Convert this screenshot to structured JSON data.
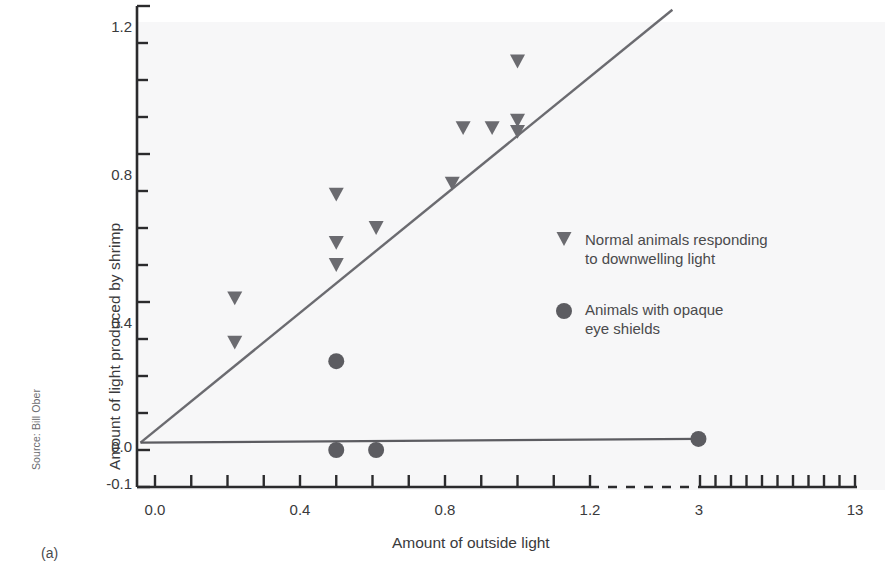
{
  "figure": {
    "panel_label": "(a)",
    "source": "Source: Bill Ober",
    "background": "#f7f7f8",
    "axis_color": "#2b2b2d",
    "marker_color": "#6b6b70",
    "line_color": "#6b6b70"
  },
  "chart_data": {
    "type": "scatter",
    "title": "",
    "xlabel": "Amount of outside light",
    "ylabel": "Amount of light produced by shrimp",
    "xlim": [
      -0.05,
      13
    ],
    "ylim": [
      -0.1,
      1.2
    ],
    "grid": false,
    "axis_break": {
      "after": 1.2,
      "resume": 3,
      "style": "dashed"
    },
    "xticks_labeled": [
      "0.0",
      "0.4",
      "0.8",
      "1.2",
      "3",
      "13"
    ],
    "xticks_labeled_values": [
      0.0,
      0.4,
      0.8,
      1.2,
      3,
      13
    ],
    "xtick_minor_step_lower": 0.1,
    "xtick_minor_count_upper": 10,
    "yticks_labeled": [
      "1.2",
      "0.8",
      "0.4",
      "0.0",
      "-0.1"
    ],
    "yticks_labeled_values": [
      1.2,
      0.8,
      0.4,
      0.0,
      -0.1
    ],
    "ytick_minor_step": 0.1,
    "legend_position": "middle-right",
    "series": [
      {
        "name": "Normal animals responding to downwelling light",
        "marker": "triangle-down",
        "color": "#6b6b70",
        "points": [
          {
            "x": 0.22,
            "y": 0.41
          },
          {
            "x": 0.22,
            "y": 0.29
          },
          {
            "x": 0.5,
            "y": 0.69
          },
          {
            "x": 0.5,
            "y": 0.56
          },
          {
            "x": 0.5,
            "y": 0.5
          },
          {
            "x": 0.61,
            "y": 0.6
          },
          {
            "x": 0.82,
            "y": 0.72
          },
          {
            "x": 0.85,
            "y": 0.87
          },
          {
            "x": 0.93,
            "y": 0.87
          },
          {
            "x": 1.0,
            "y": 1.05
          },
          {
            "x": 1.0,
            "y": 0.89
          },
          {
            "x": 1.0,
            "y": 0.86
          }
        ],
        "fit_line": {
          "x1": -0.04,
          "y1": 0.02,
          "x2": 1.22,
          "y2": 1.19
        }
      },
      {
        "name": "Animals with opaque eye shields",
        "marker": "circle",
        "color": "#5c5c61",
        "points": [
          {
            "x": 0.5,
            "y": 0.24
          },
          {
            "x": 0.5,
            "y": 0.0
          },
          {
            "x": 0.61,
            "y": 0.0
          },
          {
            "x": 2.9,
            "y": 0.03
          }
        ],
        "fit_line": {
          "x1": -0.04,
          "y1": 0.02,
          "x2": 2.9,
          "y2": 0.03
        }
      }
    ],
    "legend": [
      {
        "marker": "triangle-down",
        "line1": "Normal animals responding",
        "line2": "to downwelling light"
      },
      {
        "marker": "circle",
        "line1": "Animals with opaque",
        "line2": "eye shields"
      }
    ]
  }
}
